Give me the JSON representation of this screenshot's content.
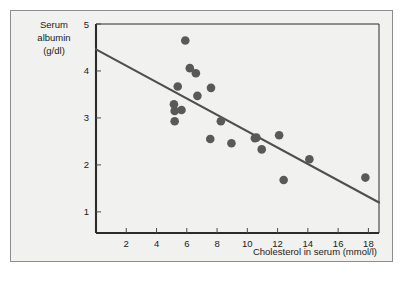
{
  "figure": {
    "panel_background": "#f1f1ef",
    "panel_border_color": "#8d8d8d",
    "point_color": "#595959",
    "line_color": "#4f4f4f",
    "axis_color": "#2b2b2b"
  },
  "chart_data": {
    "type": "scatter",
    "title": "",
    "subtitle": "",
    "xlabel": "Cholesterol in serum (mmol/l)",
    "ylabel": "Serum albumin (g/dl)",
    "ylabel_lines": [
      "Serum",
      "albumin",
      "(g/dl)"
    ],
    "xlim": [
      0,
      18.7
    ],
    "ylim": [
      0.55,
      5.0
    ],
    "xticks": [
      2,
      4,
      6,
      8,
      10,
      12,
      14,
      16,
      18
    ],
    "xtick_labels": [
      "2",
      "4",
      "6",
      "8",
      "10",
      "12",
      "14",
      "16",
      "18"
    ],
    "yticks": [
      1,
      2,
      3,
      4,
      5
    ],
    "ytick_labels": [
      "1",
      "2",
      "3",
      "4",
      "5"
    ],
    "grid": false,
    "legend": null,
    "x": [
      5.9,
      6.2,
      6.6,
      5.4,
      7.6,
      6.7,
      5.15,
      5.2,
      5.65,
      5.25,
      8.25,
      7.55,
      8.95,
      5.2,
      10.5,
      12.1,
      10.95,
      14.1,
      12.4,
      17.8,
      10.6
    ],
    "y": [
      4.65,
      4.06,
      3.95,
      3.67,
      3.64,
      3.47,
      3.29,
      3.15,
      3.17,
      2.93,
      2.93,
      2.55,
      2.46,
      2.93,
      2.57,
      2.63,
      2.33,
      2.12,
      1.68,
      1.73,
      2.58
    ],
    "points": [
      {
        "x": 5.9,
        "y": 4.65
      },
      {
        "x": 6.2,
        "y": 4.06
      },
      {
        "x": 6.6,
        "y": 3.95
      },
      {
        "x": 5.4,
        "y": 3.67
      },
      {
        "x": 7.6,
        "y": 3.64
      },
      {
        "x": 6.7,
        "y": 3.47
      },
      {
        "x": 5.15,
        "y": 3.29
      },
      {
        "x": 5.2,
        "y": 3.15
      },
      {
        "x": 5.65,
        "y": 3.17
      },
      {
        "x": 5.2,
        "y": 2.93
      },
      {
        "x": 8.25,
        "y": 2.93
      },
      {
        "x": 7.55,
        "y": 2.55
      },
      {
        "x": 8.95,
        "y": 2.46
      },
      {
        "x": 10.5,
        "y": 2.57
      },
      {
        "x": 10.6,
        "y": 2.58
      },
      {
        "x": 12.1,
        "y": 2.63
      },
      {
        "x": 10.95,
        "y": 2.33
      },
      {
        "x": 14.1,
        "y": 2.12
      },
      {
        "x": 12.4,
        "y": 1.68
      },
      {
        "x": 17.8,
        "y": 1.73
      }
    ],
    "trend_line": {
      "type": "linear-regression",
      "x_start": 0,
      "y_start": 4.46,
      "x_end": 18.7,
      "y_end": 1.2
    },
    "marker_size": 4.3
  }
}
